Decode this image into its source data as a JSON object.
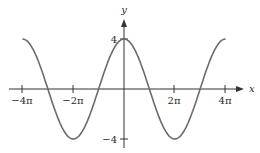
{
  "chart_data": {
    "type": "line",
    "title": "",
    "function": "y = 4cos(x/2)",
    "xlabel": "x",
    "ylabel": "y",
    "x_ticks": [
      {
        "value": -12.566,
        "label": "−4π"
      },
      {
        "value": -6.283,
        "label": "−2π"
      },
      {
        "value": 6.283,
        "label": "2π"
      },
      {
        "value": 12.566,
        "label": "4π"
      }
    ],
    "y_ticks": [
      {
        "value": 4,
        "label": "4"
      },
      {
        "value": -4,
        "label": "−4"
      }
    ],
    "xlim": [
      -12.566,
      12.566
    ],
    "ylim": [
      -4,
      4
    ],
    "grid": false,
    "legend": null,
    "series": [
      {
        "name": "4cos(x/2)",
        "x": [
          -12.566,
          -9.425,
          -6.283,
          -3.142,
          0,
          3.142,
          6.283,
          9.425,
          12.566
        ],
        "values": [
          4,
          0,
          -4,
          0,
          4,
          0,
          -4,
          0,
          4
        ]
      }
    ],
    "colors": {
      "curve": "#6b6b6b",
      "axis": "#333333"
    }
  }
}
